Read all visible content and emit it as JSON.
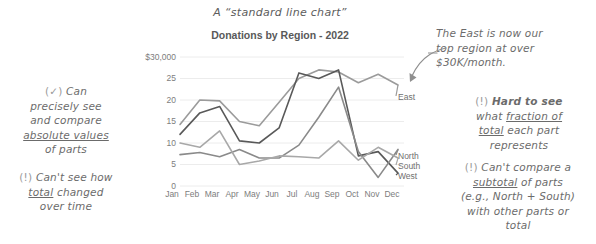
{
  "annotations": {
    "hand_title": "A “standard line chart”",
    "left_pro": {
      "mark": "(✓)",
      "line1": "Can",
      "line2": "precisely see",
      "line3": "and compare",
      "line4_u": "absolute values",
      "line5": "of parts"
    },
    "left_con": {
      "mark": "(!)",
      "line1": "Can't see how",
      "line2_u": "total",
      "line2_rest": " changed",
      "line3": "over time"
    },
    "right_callout": {
      "line1": "The East is now our",
      "line2": "top region at over",
      "line3": "$30K/month."
    },
    "right_con_1": {
      "mark": "(!)",
      "bold": "Hard to see",
      "line2a": "what ",
      "line2_u": "fraction of",
      "line3_u": "total",
      "line3b": " each part",
      "line4": "represents"
    },
    "right_con_2": {
      "mark": "(!)",
      "line1": "Can't compare a",
      "line2_u": "subtotal",
      "line2b": " of parts",
      "line3": "(e.g., North + South)",
      "line4": "with other parts or",
      "line5": "total"
    }
  },
  "chart_data": {
    "type": "line",
    "title": "Donations by Region - 2022",
    "xlabel": "",
    "ylabel": "",
    "ylim": [
      0,
      30
    ],
    "grid": true,
    "legend_position": "right-inline",
    "ytick_labels": [
      "$30,000",
      "25",
      "20",
      "15",
      "10",
      "5",
      "0"
    ],
    "ytick_values": [
      30,
      25,
      20,
      15,
      10,
      5,
      0
    ],
    "categories": [
      "Jan",
      "Feb",
      "Mar",
      "Apr",
      "May",
      "Jun",
      "Jul",
      "Aug",
      "Sep",
      "Oct",
      "Nov",
      "Dec"
    ],
    "series": [
      {
        "name": "East",
        "color": "#9b9b9b",
        "values": [
          14.3,
          20.0,
          19.8,
          15.0,
          14.0,
          19.5,
          25.0,
          27.0,
          26.5,
          24.0,
          26.0,
          23.5
        ]
      },
      {
        "name": "West",
        "color": "#595959",
        "values": [
          12.0,
          17.0,
          18.5,
          10.5,
          10.0,
          13.5,
          26.3,
          25.0,
          27.0,
          7.0,
          8.0,
          3.0
        ]
      },
      {
        "name": "North",
        "color": "#8a8a8a",
        "values": [
          7.3,
          7.8,
          6.8,
          8.5,
          6.5,
          6.5,
          9.5,
          16.0,
          23.0,
          8.0,
          2.0,
          8.5
        ]
      },
      {
        "name": "South",
        "color": "#a8a8a8",
        "values": [
          10.0,
          9.0,
          12.8,
          5.0,
          5.8,
          7.0,
          6.8,
          6.5,
          10.5,
          6.0,
          9.0,
          6.5
        ]
      }
    ]
  }
}
